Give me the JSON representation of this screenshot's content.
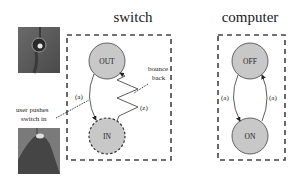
{
  "panels": {
    "switch": {
      "title": "switch",
      "states": {
        "top": "OUT",
        "bottom": "IN"
      },
      "transitions": {
        "press": "(a)",
        "bounce": "(z)"
      },
      "annotations": {
        "bounce_line1": "bounce",
        "bounce_line2": "back",
        "user_line1": "user pushes",
        "user_line2": "switch in"
      }
    },
    "computer": {
      "title": "computer",
      "states": {
        "top": "OFF",
        "bottom": "ON"
      },
      "transitions": {
        "left": "(a)",
        "right": "(a)"
      }
    }
  },
  "photos": [
    {
      "name": "switch-out-photo",
      "description": "toggle switch not pressed"
    },
    {
      "name": "switch-in-photo",
      "description": "finger pressing switch"
    }
  ],
  "colors": {
    "state_fill": "#c8c8c8",
    "stroke": "#333333",
    "background": "#ffffff"
  }
}
